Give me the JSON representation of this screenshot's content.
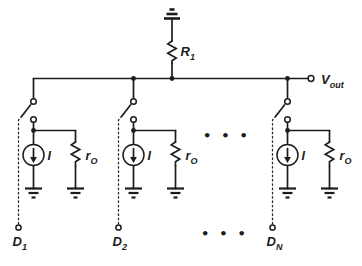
{
  "colors": {
    "ink": "#1c1c1c",
    "background": "#ffffff"
  },
  "top": {
    "resistor_label": {
      "main": "R",
      "sub": "1"
    },
    "output_label": {
      "main": "V",
      "sub": "out"
    }
  },
  "branches": [
    {
      "source_label": "I",
      "resistance_main": "r",
      "resistance_sub": "O",
      "input_main": "D",
      "input_sub": "1"
    },
    {
      "source_label": "I",
      "resistance_main": "r",
      "resistance_sub": "O",
      "input_main": "D",
      "input_sub": "2"
    },
    {
      "source_label": "I",
      "resistance_main": "r",
      "resistance_sub": "O",
      "input_main": "D",
      "input_sub": "N"
    }
  ],
  "ellipsis": {
    "top": "•••",
    "bottom": "•••"
  }
}
